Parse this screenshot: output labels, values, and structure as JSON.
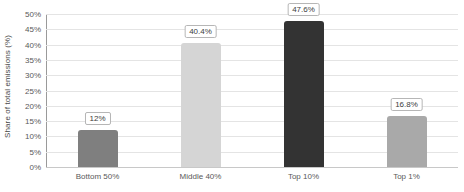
{
  "chart_data": {
    "type": "bar",
    "title": "",
    "subtitle": "",
    "xlabel": "",
    "ylabel": "Share of total emissions (%)",
    "categories": [
      "Bottom 50%",
      "Middle 40%",
      "Top 10%",
      "Top 1%"
    ],
    "values": [
      12,
      40.4,
      47.6,
      16.8
    ],
    "data_labels": [
      "12%",
      "40.4%",
      "47.6%",
      "16.8%"
    ],
    "bar_colors": [
      "#7f7f7f",
      "#d5d5d5",
      "#333333",
      "#a9a9a9"
    ],
    "ylim": [
      0,
      50
    ],
    "ytick_values": [
      0,
      5,
      10,
      15,
      20,
      25,
      30,
      35,
      40,
      45,
      50
    ],
    "ytick_labels": [
      "0%",
      "5%",
      "10%",
      "15%",
      "20%",
      "25%",
      "30%",
      "35%",
      "40%",
      "45%",
      "50%"
    ],
    "grid": true,
    "grid_axis": "y",
    "legend": false,
    "legend_position": "none",
    "gridline_color": "#e4e4e4",
    "axis_color": "#9a9a9a",
    "background_color": "#ffffff",
    "label_text_color": "#595959"
  }
}
